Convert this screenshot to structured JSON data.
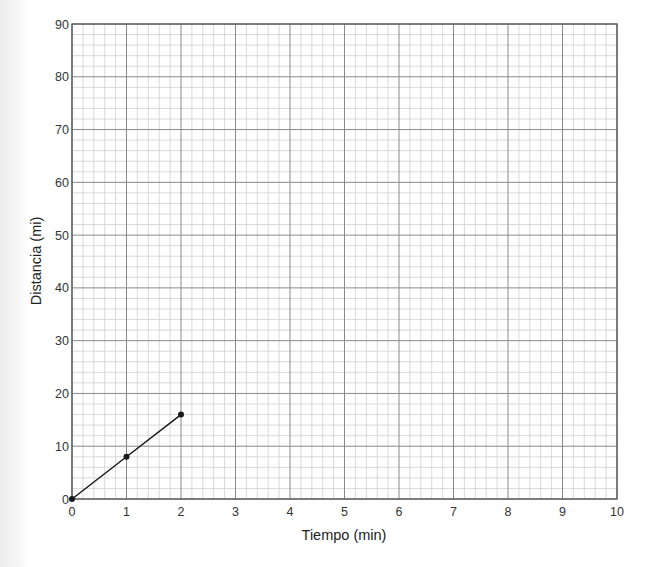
{
  "chart_data": {
    "type": "line",
    "title": "",
    "xlabel": "Tiempo (min)",
    "ylabel": "Distancia (mi)",
    "xlim": [
      0,
      10
    ],
    "ylim": [
      0,
      90
    ],
    "x_ticks": [
      "0",
      "1",
      "2",
      "3",
      "4",
      "5",
      "6",
      "7",
      "8",
      "9",
      "10"
    ],
    "y_ticks": [
      "0",
      "10",
      "20",
      "30",
      "40",
      "50",
      "60",
      "70",
      "80",
      "90"
    ],
    "grid": true,
    "minor_divisions": 5,
    "legend": null,
    "series": [
      {
        "name": "Distancia",
        "x": [
          0,
          1,
          2
        ],
        "y": [
          0,
          8,
          16
        ],
        "markers": true,
        "color": "#1a1a1a"
      }
    ]
  },
  "colors": {
    "major_grid": "#8a8a8a",
    "minor_grid": "#cfcfcf",
    "frame": "#555555",
    "line": "#1a1a1a"
  }
}
